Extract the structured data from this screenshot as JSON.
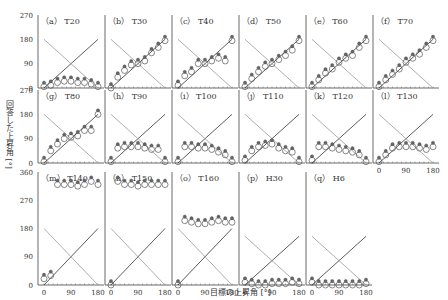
{
  "chart_data": {
    "type": "scatter",
    "title": "",
    "xlabel": "目標の上昇角 [°]",
    "ylabel": "回答した上昇角 [°]",
    "x_ticks": [
      0,
      90,
      180
    ],
    "y_ticks": [
      0,
      90,
      180,
      270
    ],
    "y_ticks_extended": [
      0,
      90,
      180,
      270,
      360
    ],
    "xlim": [
      0,
      180
    ],
    "ylim": [
      0,
      270
    ],
    "reference_lines": [
      "y = x (target)",
      "y = 180 - x (front-back reversal)"
    ],
    "grid": false,
    "legend": "none",
    "panels": [
      {
        "id": "a",
        "label": "（a） T20",
        "x": [
          0,
          22.5,
          45,
          67.5,
          90,
          112.5,
          135,
          157.5,
          180
        ],
        "y": [
          5,
          10,
          20,
          25,
          25,
          20,
          20,
          15,
          5
        ]
      },
      {
        "id": "b",
        "label": "（b） T30",
        "x": [
          0,
          22.5,
          45,
          67.5,
          90,
          112.5,
          135,
          157.5,
          180
        ],
        "y": [
          0,
          40,
          65,
          85,
          90,
          100,
          130,
          150,
          175
        ]
      },
      {
        "id": "c",
        "label": "（c） T40",
        "x": [
          0,
          22.5,
          45,
          67.5,
          90,
          112.5,
          135,
          157.5,
          180
        ],
        "y": [
          10,
          45,
          60,
          90,
          90,
          100,
          110,
          100,
          175
        ]
      },
      {
        "id": "d",
        "label": "（d） T50",
        "x": [
          0,
          22.5,
          45,
          67.5,
          90,
          112.5,
          135,
          157.5,
          180
        ],
        "y": [
          5,
          35,
          60,
          80,
          90,
          105,
          120,
          140,
          175
        ]
      },
      {
        "id": "e",
        "label": "（e） T60",
        "x": [
          0,
          22.5,
          45,
          67.5,
          90,
          112.5,
          135,
          157.5,
          180
        ],
        "y": [
          5,
          30,
          55,
          70,
          95,
          110,
          120,
          150,
          175
        ]
      },
      {
        "id": "f",
        "label": "（f） T70",
        "x": [
          0,
          22.5,
          45,
          67.5,
          90,
          112.5,
          135,
          157.5,
          180
        ],
        "y": [
          5,
          30,
          50,
          70,
          95,
          110,
          125,
          150,
          175
        ]
      },
      {
        "id": "g",
        "label": "（g） T80",
        "x": [
          0,
          22.5,
          45,
          67.5,
          90,
          112.5,
          135,
          157.5,
          180
        ],
        "y": [
          5,
          45,
          70,
          90,
          95,
          100,
          120,
          120,
          180
        ]
      },
      {
        "id": "h",
        "label": "（h） T90",
        "x": [
          0,
          22.5,
          45,
          67.5,
          90,
          112.5,
          135,
          157.5,
          180
        ],
        "y": [
          5,
          55,
          60,
          60,
          60,
          55,
          50,
          50,
          5
        ]
      },
      {
        "id": "i",
        "label": "（i） T100",
        "x": [
          0,
          22.5,
          45,
          67.5,
          90,
          112.5,
          135,
          157.5,
          180
        ],
        "y": [
          5,
          60,
          60,
          55,
          55,
          50,
          40,
          30,
          5
        ]
      },
      {
        "id": "j",
        "label": "（j） T110",
        "x": [
          0,
          22.5,
          45,
          67.5,
          90,
          112.5,
          135,
          157.5,
          180
        ],
        "y": [
          10,
          45,
          60,
          65,
          70,
          55,
          45,
          40,
          5
        ]
      },
      {
        "id": "k",
        "label": "（k） T120",
        "x": [
          0,
          22.5,
          45,
          67.5,
          90,
          112.5,
          135,
          157.5,
          180
        ],
        "y": [
          10,
          60,
          60,
          55,
          50,
          45,
          40,
          30,
          5
        ]
      },
      {
        "id": "l",
        "label": "（l） T130",
        "x": [
          0,
          22.5,
          45,
          67.5,
          90,
          112.5,
          135,
          157.5,
          180
        ],
        "y": [
          5,
          30,
          55,
          60,
          60,
          60,
          55,
          50,
          60
        ]
      },
      {
        "id": "m",
        "label": "（m） T140",
        "x": [
          0,
          22.5,
          45,
          67.5,
          90,
          112.5,
          135,
          157.5,
          180
        ],
        "y": [
          20,
          30,
          320,
          320,
          320,
          315,
          320,
          330,
          320
        ]
      },
      {
        "id": "n",
        "label": "（n） T150",
        "x": [
          0,
          22.5,
          45,
          67.5,
          90,
          112.5,
          135,
          157.5,
          180
        ],
        "y": [
          0,
          330,
          320,
          320,
          315,
          320,
          320,
          320,
          320
        ]
      },
      {
        "id": "o",
        "label": "（o） T160",
        "x": [
          0,
          22.5,
          45,
          67.5,
          90,
          112.5,
          135,
          157.5,
          180
        ],
        "y": [
          0,
          205,
          200,
          195,
          195,
          200,
          205,
          200,
          200
        ]
      },
      {
        "id": "p",
        "label": "（p） H30",
        "x": [
          0,
          22.5,
          45,
          67.5,
          90,
          112.5,
          135,
          157.5,
          180
        ],
        "y": [
          10,
          5,
          0,
          0,
          5,
          5,
          5,
          10,
          5
        ]
      },
      {
        "id": "q",
        "label": "（q） H6",
        "x": [
          0,
          22.5,
          45,
          67.5,
          90,
          112.5,
          135,
          157.5,
          180
        ],
        "y": [
          10,
          0,
          0,
          0,
          0,
          0,
          0,
          0,
          5
        ]
      }
    ]
  },
  "figure": {
    "x_axis_label": "目標の上昇角 [°]",
    "y_axis_label": "回答した上昇角 [°]"
  }
}
